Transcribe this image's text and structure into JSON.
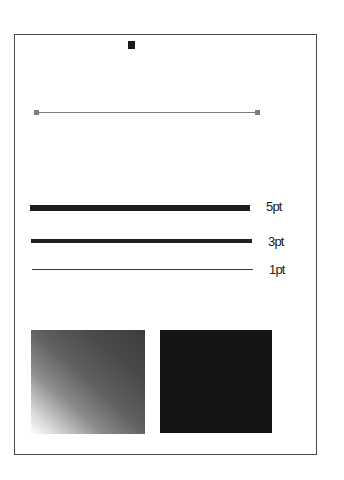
{
  "canvas": {
    "frame_color": "#4a4a4a",
    "background": "#ffffff"
  },
  "marker": {
    "color": "#1a1a1a"
  },
  "selected_line": {
    "color": "#7a7a7a",
    "handle_color": "#7d7d7d"
  },
  "strokes": [
    {
      "label": "5pt",
      "weight": 5,
      "color": "#1c1c1c"
    },
    {
      "label": "3pt",
      "weight": 3,
      "color": "#222222"
    },
    {
      "label": "1pt",
      "weight": 1,
      "color": "#3a3a3a"
    }
  ],
  "swatches": [
    {
      "type": "gradient",
      "from": "#ffffff",
      "to": "#3d3d3d",
      "direction": "bottom-left to top-right"
    },
    {
      "type": "solid",
      "color": "#151515"
    }
  ]
}
